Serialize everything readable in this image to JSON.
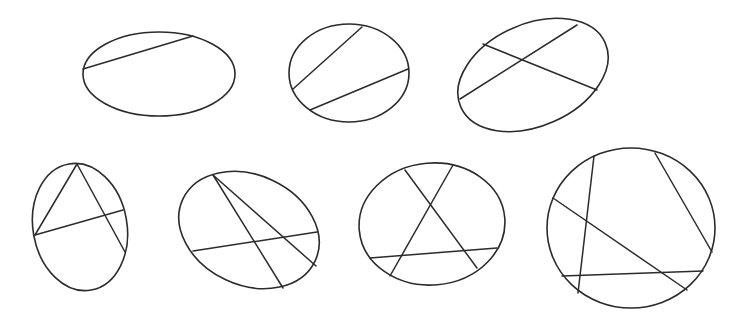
{
  "figure": {
    "width": 749,
    "height": 324,
    "background": "#ffffff",
    "stroke_color": "#2b2b2b"
  },
  "ellipses": [
    {
      "id": "ellipse-1",
      "cx": 159,
      "cy": 74,
      "rx": 76,
      "ry": 42,
      "rotation": 0,
      "chords": [
        {
          "x1": 83,
          "y1": 69,
          "x2": 193,
          "y2": 36
        }
      ]
    },
    {
      "id": "ellipse-2",
      "cx": 349,
      "cy": 73,
      "rx": 60,
      "ry": 49,
      "rotation": 0,
      "chords": [
        {
          "x1": 293,
          "y1": 89,
          "x2": 362,
          "y2": 27
        },
        {
          "x1": 310,
          "y1": 110,
          "x2": 408,
          "y2": 69
        }
      ]
    },
    {
      "id": "ellipse-3",
      "cx": 533,
      "cy": 75,
      "rx": 79,
      "ry": 51,
      "rotation": -24,
      "chords": [
        {
          "x1": 460,
          "y1": 99,
          "x2": 577,
          "y2": 25
        },
        {
          "x1": 483,
          "y1": 44,
          "x2": 597,
          "y2": 90
        }
      ]
    },
    {
      "id": "ellipse-4",
      "cx": 80,
      "cy": 227,
      "rx": 47,
      "ry": 64,
      "rotation": -10,
      "chords": [
        {
          "x1": 77,
          "y1": 164,
          "x2": 35,
          "y2": 235
        },
        {
          "x1": 77,
          "y1": 164,
          "x2": 125,
          "y2": 252
        },
        {
          "x1": 35,
          "y1": 235,
          "x2": 123,
          "y2": 210
        }
      ]
    },
    {
      "id": "ellipse-5",
      "cx": 249,
      "cy": 230,
      "rx": 73,
      "ry": 55,
      "rotation": 25,
      "chords": [
        {
          "x1": 213,
          "y1": 175,
          "x2": 283,
          "y2": 288
        },
        {
          "x1": 213,
          "y1": 175,
          "x2": 316,
          "y2": 266
        },
        {
          "x1": 193,
          "y1": 251,
          "x2": 317,
          "y2": 232
        }
      ]
    },
    {
      "id": "ellipse-6",
      "cx": 432,
      "cy": 224,
      "rx": 73,
      "ry": 61,
      "rotation": -5,
      "chords": [
        {
          "x1": 405,
          "y1": 170,
          "x2": 477,
          "y2": 268
        },
        {
          "x1": 453,
          "y1": 165,
          "x2": 390,
          "y2": 276
        },
        {
          "x1": 370,
          "y1": 258,
          "x2": 497,
          "y2": 248
        }
      ]
    },
    {
      "id": "ellipse-7",
      "cx": 631,
      "cy": 228,
      "rx": 84,
      "ry": 80,
      "rotation": 0,
      "chords": [
        {
          "x1": 594,
          "y1": 156,
          "x2": 578,
          "y2": 293
        },
        {
          "x1": 655,
          "y1": 153,
          "x2": 712,
          "y2": 252
        },
        {
          "x1": 553,
          "y1": 198,
          "x2": 687,
          "y2": 290
        },
        {
          "x1": 562,
          "y1": 276,
          "x2": 703,
          "y2": 271
        }
      ]
    }
  ]
}
